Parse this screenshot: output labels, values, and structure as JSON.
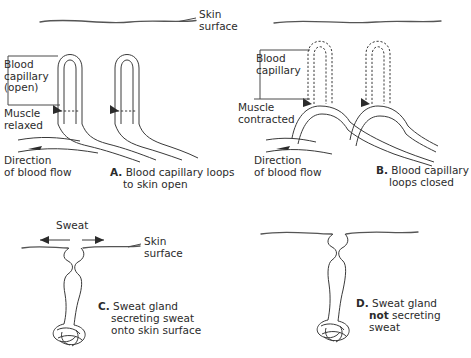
{
  "figure": {
    "line_color": "#3a3a3a",
    "skin_color": "#555555",
    "background": "#ffffff"
  },
  "panels": {
    "a": {
      "letter": "A.",
      "caption_line1": "Blood capillary loops",
      "caption_line2": "to skin open",
      "labels": {
        "skin_line1": "Skin",
        "skin_line2": "surface",
        "capillary_line1": "Blood",
        "capillary_line2": "capillary",
        "capillary_line3": "(open)",
        "muscle_line1": "Muscle",
        "muscle_line2": "relaxed",
        "direction_line1": "Direction",
        "direction_line2": "of blood flow"
      }
    },
    "b": {
      "letter": "B.",
      "caption_line1": "Blood capillary",
      "caption_line2": "loops closed",
      "labels": {
        "capillary_line1": "Blood",
        "capillary_line2": "capillary",
        "muscle_line1": "Muscle",
        "muscle_line2": "contracted",
        "direction_line1": "Direction",
        "direction_line2": "of blood flow"
      }
    },
    "c": {
      "letter": "C.",
      "caption_line1": "Sweat gland",
      "caption_line2": "secreting sweat",
      "caption_line3": "onto skin surface",
      "labels": {
        "sweat": "Sweat",
        "skin_line1": "Skin",
        "skin_line2": "surface"
      }
    },
    "d": {
      "letter": "D.",
      "caption_pre": "Sweat gland",
      "caption_bold": "not",
      "caption_mid": " secreting",
      "caption_line3": "sweat"
    }
  }
}
